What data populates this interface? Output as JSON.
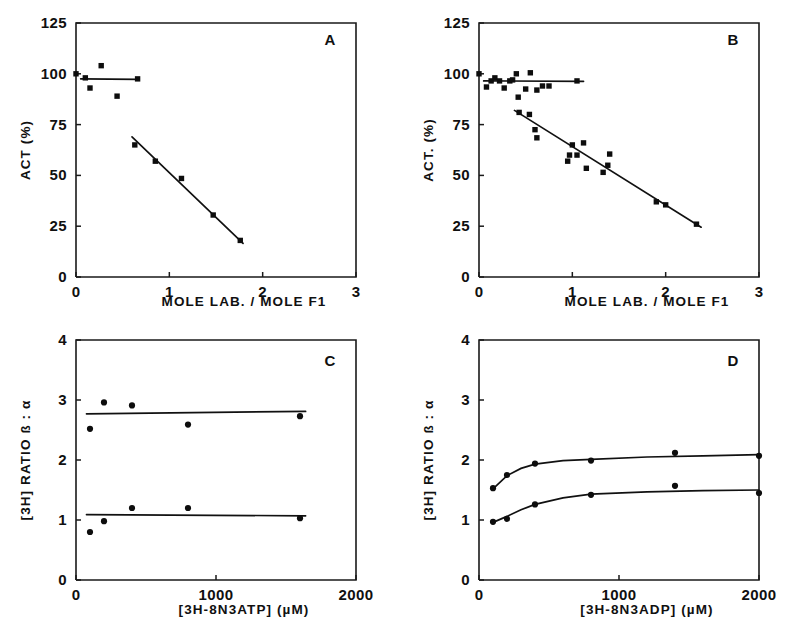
{
  "figure": {
    "background": "#ffffff",
    "ink": "#111111",
    "panel_letters": [
      "A",
      "B",
      "C",
      "D"
    ]
  },
  "chart_data": [
    {
      "id": "panel-a",
      "type": "scatter",
      "title": "A",
      "xlabel": "MOLE LAB. / MOLE F1",
      "ylabel": "ACT (%)",
      "xlim": [
        0,
        3
      ],
      "ylim": [
        0,
        125
      ],
      "xticks": [
        0,
        1,
        2,
        3
      ],
      "yticks": [
        0,
        25,
        50,
        75,
        100,
        125
      ],
      "xticklabels": [
        "0",
        "1",
        "2",
        "3"
      ],
      "yticklabels": [
        "0",
        "25",
        "50",
        "75",
        "100",
        "125"
      ],
      "grid": false,
      "legend": "none",
      "series": [
        {
          "name": "control activity (flat)",
          "marker": "filled-square",
          "points": [
            [
              0.0,
              100.0
            ],
            [
              0.1,
              98.0
            ],
            [
              0.15,
              93.0
            ],
            [
              0.27,
              104.0
            ],
            [
              0.44,
              89.0
            ],
            [
              0.66,
              97.5
            ]
          ],
          "fit": {
            "type": "line",
            "x": [
              0.05,
              0.67
            ],
            "y": [
              97.5,
              97.3
            ]
          }
        },
        {
          "name": "inactivation (descending)",
          "marker": "filled-square",
          "points": [
            [
              0.63,
              65.0
            ],
            [
              0.85,
              57.0
            ],
            [
              1.13,
              48.5
            ],
            [
              1.47,
              30.5
            ],
            [
              1.76,
              18.0
            ]
          ],
          "fit": {
            "type": "line",
            "x": [
              0.6,
              1.79
            ],
            "y": [
              69.0,
              16.5
            ]
          }
        }
      ]
    },
    {
      "id": "panel-b",
      "type": "scatter",
      "title": "B",
      "xlabel": "MOLE LAB. / MOLE F1",
      "ylabel": "ACT. (%)",
      "xlim": [
        0,
        3
      ],
      "ylim": [
        0,
        125
      ],
      "xticks": [
        0,
        1,
        2,
        3
      ],
      "yticks": [
        0,
        25,
        50,
        75,
        100,
        125
      ],
      "xticklabels": [
        "0",
        "1",
        "2",
        "3"
      ],
      "yticklabels": [
        "0",
        "25",
        "50",
        "75",
        "100",
        "125"
      ],
      "grid": false,
      "legend": "none",
      "series": [
        {
          "name": "control activity (flat)",
          "marker": "filled-square",
          "points": [
            [
              0.0,
              100.0
            ],
            [
              0.08,
              93.5
            ],
            [
              0.13,
              96.5
            ],
            [
              0.17,
              98.0
            ],
            [
              0.22,
              96.5
            ],
            [
              0.27,
              93.0
            ],
            [
              0.33,
              96.5
            ],
            [
              0.36,
              97.0
            ],
            [
              0.4,
              100.0
            ],
            [
              0.42,
              88.5
            ],
            [
              0.5,
              92.5
            ],
            [
              0.55,
              100.5
            ],
            [
              0.62,
              92.0
            ],
            [
              0.68,
              94.0
            ],
            [
              0.75,
              94.0
            ],
            [
              1.05,
              96.5
            ]
          ],
          "fit": {
            "type": "line",
            "x": [
              0.05,
              1.12
            ],
            "y": [
              96.5,
              96.3
            ]
          }
        },
        {
          "name": "inactivation (descending)",
          "marker": "filled-square",
          "points": [
            [
              0.43,
              81.0
            ],
            [
              0.54,
              80.0
            ],
            [
              0.6,
              72.5
            ],
            [
              0.62,
              68.5
            ],
            [
              0.95,
              57.0
            ],
            [
              0.97,
              60.0
            ],
            [
              1.0,
              65.0
            ],
            [
              1.05,
              60.0
            ],
            [
              1.12,
              66.0
            ],
            [
              1.15,
              53.5
            ],
            [
              1.33,
              51.5
            ],
            [
              1.38,
              55.0
            ],
            [
              1.4,
              60.5
            ],
            [
              1.9,
              37.0
            ],
            [
              2.0,
              35.5
            ],
            [
              2.33,
              26.0
            ]
          ],
          "fit": {
            "type": "line",
            "x": [
              0.38,
              2.38
            ],
            "y": [
              82.0,
              24.5
            ]
          }
        }
      ]
    },
    {
      "id": "panel-c",
      "type": "scatter",
      "title": "C",
      "xlabel": "[3H-8N3ATP] (µM)",
      "ylabel": "[3H] RATIO ß : α",
      "xlim": [
        0,
        2000
      ],
      "ylim": [
        0,
        4
      ],
      "xticks": [
        0,
        1000,
        2000
      ],
      "yticks": [
        0,
        1,
        2,
        3,
        4
      ],
      "xticklabels": [
        "0",
        "1000",
        "2000"
      ],
      "yticklabels": [
        "0",
        "1",
        "2",
        "3",
        "4"
      ],
      "grid": false,
      "legend": "none",
      "series": [
        {
          "name": "upper set",
          "marker": "filled-circle",
          "points": [
            [
              100,
              2.52
            ],
            [
              200,
              2.96
            ],
            [
              400,
              2.91
            ],
            [
              800,
              2.59
            ],
            [
              1600,
              2.73
            ]
          ],
          "fit": {
            "type": "line",
            "x": [
              75,
              1640
            ],
            "y": [
              2.77,
              2.81
            ]
          }
        },
        {
          "name": "lower set",
          "marker": "filled-circle",
          "points": [
            [
              100,
              0.8
            ],
            [
              200,
              0.98
            ],
            [
              400,
              1.2
            ],
            [
              800,
              1.2
            ],
            [
              1600,
              1.03
            ]
          ],
          "fit": {
            "type": "line",
            "x": [
              75,
              1640
            ],
            "y": [
              1.09,
              1.07
            ]
          }
        }
      ]
    },
    {
      "id": "panel-d",
      "type": "scatter",
      "title": "D",
      "xlabel": "[3H-8N3ADP] (µM)",
      "ylabel": "[3H] RATIO ß : α",
      "xlim": [
        0,
        2000
      ],
      "ylim": [
        0,
        4
      ],
      "xticks": [
        0,
        1000,
        2000
      ],
      "yticks": [
        0,
        1,
        2,
        3,
        4
      ],
      "xticklabels": [
        "0",
        "1000",
        "2000"
      ],
      "yticklabels": [
        "0",
        "1",
        "2",
        "3",
        "4"
      ],
      "grid": false,
      "legend": "none",
      "series": [
        {
          "name": "upper saturation curve",
          "marker": "filled-circle",
          "points": [
            [
              100,
              1.53
            ],
            [
              200,
              1.75
            ],
            [
              400,
              1.94
            ],
            [
              800,
              1.99
            ],
            [
              1400,
              2.12
            ],
            [
              2000,
              2.07
            ]
          ],
          "fit": {
            "type": "curve",
            "x": [
              100,
              200,
              300,
              400,
              600,
              800,
              1200,
              1600,
              2000
            ],
            "y": [
              1.52,
              1.74,
              1.86,
              1.93,
              1.99,
              2.01,
              2.05,
              2.07,
              2.09
            ]
          }
        },
        {
          "name": "lower saturation curve",
          "marker": "filled-circle",
          "points": [
            [
              100,
              0.97
            ],
            [
              200,
              1.02
            ],
            [
              400,
              1.26
            ],
            [
              800,
              1.42
            ],
            [
              1400,
              1.57
            ],
            [
              2000,
              1.45
            ]
          ],
          "fit": {
            "type": "curve",
            "x": [
              100,
              200,
              300,
              400,
              600,
              800,
              1200,
              1600,
              2000
            ],
            "y": [
              0.96,
              1.06,
              1.17,
              1.26,
              1.37,
              1.43,
              1.47,
              1.49,
              1.5
            ]
          }
        }
      ]
    }
  ]
}
